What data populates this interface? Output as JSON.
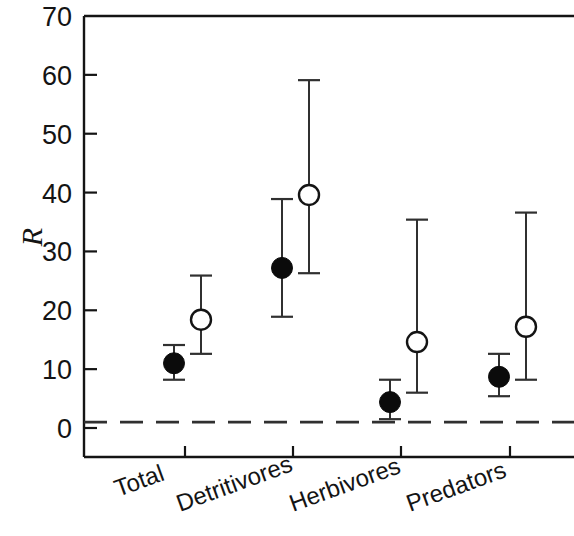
{
  "chart_data": {
    "type": "scatter",
    "title": "",
    "subtitle": "",
    "xlabel": "",
    "ylabel": "R",
    "categories": [
      "Total",
      "Detritivores",
      "Herbivores",
      "Predators"
    ],
    "ylim": [
      0,
      70
    ],
    "yticks": [
      0,
      10,
      20,
      30,
      40,
      50,
      60,
      70
    ],
    "ytick_labels": [
      "0",
      "10",
      "20",
      "30",
      "40",
      "50",
      "60",
      "70"
    ],
    "grid": false,
    "legend": "none",
    "reference_line": {
      "value": 1,
      "style": "dashed",
      "label": ""
    },
    "series": [
      {
        "name": "filled",
        "marker": "filled-circle",
        "color": "#0b0b0b",
        "values": [
          11.0,
          27.2,
          4.4,
          8.7
        ],
        "err_low": [
          8.2,
          18.9,
          1.5,
          5.4
        ],
        "err_high": [
          14.1,
          38.9,
          8.2,
          12.6
        ]
      },
      {
        "name": "open",
        "marker": "open-circle",
        "color": "#ffffff",
        "values": [
          18.4,
          39.6,
          14.6,
          17.2
        ],
        "err_low": [
          12.6,
          26.3,
          6.0,
          8.2
        ],
        "err_high": [
          25.9,
          59.1,
          35.4,
          36.6
        ]
      }
    ]
  },
  "axis": {
    "y_title": "R",
    "label_rotation_deg": -20
  }
}
